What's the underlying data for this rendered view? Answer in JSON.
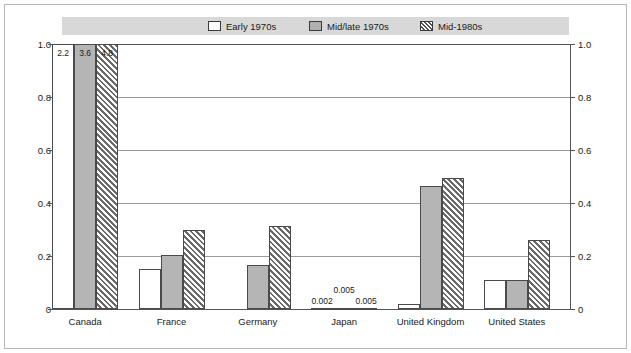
{
  "chart_data": {
    "type": "bar",
    "title": "",
    "xlabel": "",
    "ylabel": "",
    "ylim": [
      0,
      1.0
    ],
    "grid": true,
    "legend_position": "top",
    "categories": [
      "Canada",
      "France",
      "Germany",
      "Japan",
      "United Kingdom",
      "United States"
    ],
    "yticks": [
      "1.0",
      "0.8",
      "0.6",
      "0.4",
      "0.2",
      "0"
    ],
    "ytick_values": [
      1.0,
      0.8,
      0.6,
      0.4,
      0.2,
      0
    ],
    "series": [
      {
        "name": "Early 1970s",
        "values": [
          2.2,
          0.15,
          0.0,
          0.002,
          0.02,
          0.11
        ],
        "labels": [
          "2.2",
          "",
          "",
          "0.002",
          "",
          ""
        ]
      },
      {
        "name": "Mid/late 1970s",
        "values": [
          3.6,
          0.205,
          0.165,
          0.005,
          0.465,
          0.11
        ],
        "labels": [
          "3.6",
          "",
          "",
          "0.005",
          "",
          ""
        ]
      },
      {
        "name": "Mid-1980s",
        "values": [
          4.8,
          0.3,
          0.315,
          0.005,
          0.495,
          0.26
        ],
        "labels": [
          "4.8",
          "",
          "",
          "0.005",
          "",
          ""
        ]
      }
    ],
    "clipped_note": "Canada bars exceed the 1.0 axis maximum and are clipped; their values are printed inside the bars."
  },
  "legend": {
    "items": [
      {
        "label": "Early 1970s",
        "swatch": "white-square-icon"
      },
      {
        "label": "Mid/late 1970s",
        "swatch": "gray-square-icon"
      },
      {
        "label": "Mid-1980s",
        "swatch": "hatched-square-icon"
      }
    ]
  },
  "colors": {
    "early": "#ffffff",
    "mid_late": "#b5b5b5",
    "mid_1980s_hatch": "#6a6a6a",
    "axis": "#555555",
    "grid": "#9a9a9a",
    "legend_band": "#d8d8d8",
    "frame": "#b8b8b8"
  }
}
